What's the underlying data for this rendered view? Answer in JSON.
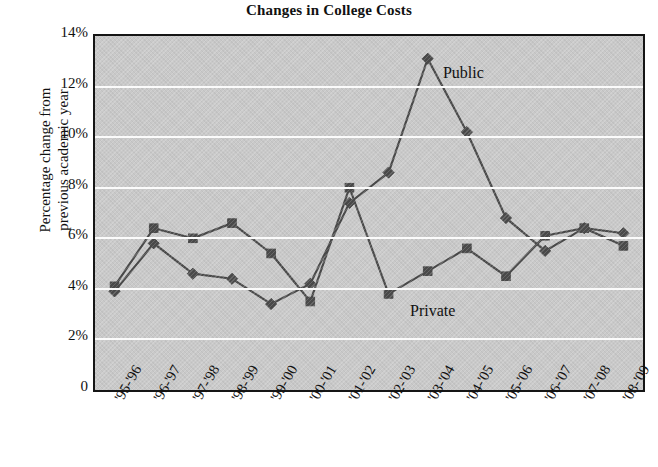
{
  "chart_data": {
    "type": "line",
    "title": "Changes in College Costs",
    "xlabel": "",
    "ylabel": "Percentage change from previous academic year",
    "ylabel_lines": [
      "Percentage change from",
      "previous academic year"
    ],
    "ylim": [
      0,
      14
    ],
    "yticks": [
      0,
      2,
      4,
      6,
      8,
      10,
      12,
      14
    ],
    "ytick_labels": [
      "0",
      "2%",
      "4%",
      "6%",
      "8%",
      "10%",
      "12%",
      "14%"
    ],
    "grid": true,
    "grid_axis": "y",
    "legend_position": "inline-annotations",
    "categories": [
      "'95-'96",
      "'96-'97",
      "'97-'98",
      "'98-'99",
      "'99-'00",
      "'00-'01",
      "'01-'02",
      "'02-'03",
      "'03-'04",
      "'04-'05",
      "'05-'06",
      "'06-'07",
      "'07-'08",
      "'08-'09"
    ],
    "series": [
      {
        "name": "Private",
        "marker": "square",
        "color": "#4a4a4a",
        "values": [
          4.1,
          6.4,
          6.0,
          6.6,
          5.4,
          3.5,
          8.0,
          3.8,
          4.7,
          5.6,
          4.5,
          6.1,
          6.4,
          5.7
        ]
      },
      {
        "name": "Public",
        "marker": "diamond",
        "color": "#4a4a4a",
        "values": [
          3.9,
          5.8,
          4.6,
          4.4,
          3.4,
          4.2,
          7.4,
          8.6,
          13.1,
          10.2,
          6.8,
          5.5,
          6.4,
          6.2
        ]
      }
    ],
    "annotations": [
      {
        "text": "Public",
        "series": "Public",
        "x": 0.635,
        "y": 12.5
      },
      {
        "text": "Private",
        "series": "Private",
        "x": 0.575,
        "y": 3.1
      }
    ],
    "colors": {
      "plot_background": "#c9c9c9",
      "gridline": "#fbfbfb",
      "axis": "#151515",
      "line": "#4a4a4a",
      "page_background": "#ffffff",
      "text": "#111111"
    }
  }
}
